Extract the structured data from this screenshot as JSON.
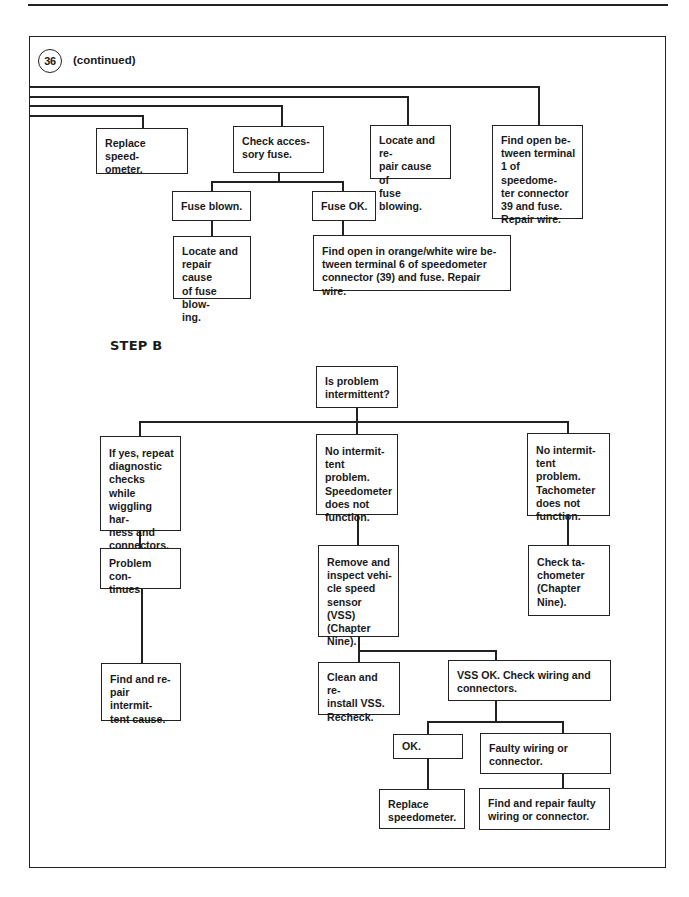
{
  "page": {
    "number": "24"
  },
  "header": {
    "step_number": "36",
    "continued_label": "(continued)"
  },
  "step_a": {
    "boxes": {
      "replace_speedometer": "Replace speed-\nometer.",
      "check_accessory_fuse": "Check acces-\nsory fuse.",
      "locate_repair_fuse_top": "Locate and re-\npair cause of\nfuse blowing.",
      "find_open_terminal_1": "Find open be-\ntween terminal\n1 of speedome-\nter connector\n39 and fuse.\nRepair wire.",
      "fuse_blown": "Fuse blown.",
      "fuse_ok": "Fuse OK.",
      "locate_repair_fuse_left": "Locate and\nrepair cause\nof fuse blow-\ning.",
      "find_open_orange_white": "Find open in orange/white wire be-\ntween terminal 6 of speedometer\nconnector (39) and fuse. Repair wire."
    }
  },
  "step_b": {
    "title": "STEP B",
    "boxes": {
      "is_intermittent": "Is problem\nintermittent?",
      "if_yes_repeat": "If yes, repeat\ndiagnostic\nchecks while\nwiggling har-\nness and\nconnectors.",
      "no_intermittent_speedo": "No intermit-\ntent problem.\nSpeedometer\ndoes not\nfunction.",
      "no_intermittent_tach": "No intermit-\ntent problem.\nTachometer\ndoes not\nfunction.",
      "problem_continues": "Problem con-\ntinues.",
      "remove_inspect_vss": "Remove and\ninspect vehi-\ncle speed\nsensor (VSS)\n(Chapter\nNine).",
      "check_tachometer": "Check ta-\nchometer\n(Chapter\nNine).",
      "find_repair_intermittent": "Find and re-\npair intermit-\ntent cause.",
      "clean_reinstall_vss": "Clean and re-\ninstall VSS.\nRecheck.",
      "vss_ok_check_wiring": "VSS OK. Check wiring and\nconnectors.",
      "ok": "OK.",
      "faulty_wiring": "Faulty wiring or\nconnector.",
      "replace_speedometer": "Replace\nspeedometer.",
      "find_repair_faulty_wiring": "Find and repair faulty\nwiring or connector."
    }
  },
  "colors": {
    "ink": "#222222",
    "paper": "#ffffff"
  }
}
